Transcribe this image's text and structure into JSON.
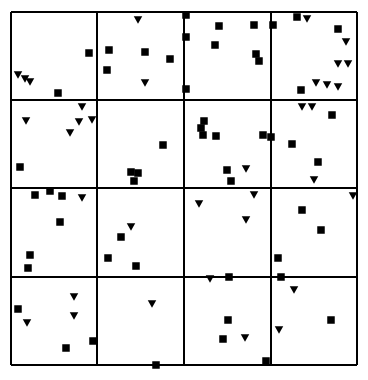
{
  "figure": {
    "name": "lattice-scatter-panel",
    "background_color": "#ffffff",
    "ink_color": "#000000",
    "width": 368,
    "height": 380
  },
  "chart_data": {
    "type": "scatter",
    "title": "",
    "subtitle": "",
    "xlabel": "",
    "ylabel": "",
    "grid": true,
    "legend_position": "none",
    "axis_ticks_visible": false,
    "tick_labels": [],
    "annotations": [],
    "xlim": [
      0,
      4
    ],
    "ylim": [
      0,
      4
    ],
    "panel": {
      "rows": 4,
      "cols": 4,
      "left": 11,
      "top": 12,
      "right": 357,
      "bottom": 365,
      "col_edges": [
        11,
        97,
        184,
        271,
        357
      ],
      "row_edges": [
        12,
        100,
        188,
        277,
        365
      ],
      "border_width": 1.6,
      "border_color": "#000000"
    },
    "marker_styles": {
      "square": {
        "name": "filled-square",
        "size": 7.5,
        "color": "#000000"
      },
      "triangle": {
        "name": "filled-down-triangle",
        "size": 8.5,
        "color": "#000000"
      }
    },
    "series": [
      {
        "name": "square",
        "marker": "square",
        "points": [
          [
            89,
            53
          ],
          [
            58,
            93
          ],
          [
            109,
            50
          ],
          [
            145,
            52
          ],
          [
            170,
            59
          ],
          [
            107,
            70
          ],
          [
            186,
            15
          ],
          [
            219,
            26
          ],
          [
            254,
            25
          ],
          [
            186,
            37
          ],
          [
            215,
            45
          ],
          [
            256,
            54
          ],
          [
            259,
            61
          ],
          [
            186,
            89
          ],
          [
            297,
            17
          ],
          [
            273,
            25
          ],
          [
            338,
            29
          ],
          [
            301,
            90
          ],
          [
            20,
            167
          ],
          [
            163,
            145
          ],
          [
            131,
            172
          ],
          [
            138,
            173
          ],
          [
            134,
            181
          ],
          [
            204,
            121
          ],
          [
            201,
            128
          ],
          [
            203,
            135
          ],
          [
            216,
            136
          ],
          [
            263,
            135
          ],
          [
            271,
            137
          ],
          [
            227,
            170
          ],
          [
            231,
            181
          ],
          [
            332,
            115
          ],
          [
            292,
            144
          ],
          [
            318,
            162
          ],
          [
            35,
            195
          ],
          [
            50,
            191
          ],
          [
            62,
            196
          ],
          [
            60,
            222
          ],
          [
            30,
            255
          ],
          [
            28,
            268
          ],
          [
            121,
            237
          ],
          [
            108,
            258
          ],
          [
            136,
            266
          ],
          [
            281,
            277
          ],
          [
            302,
            210
          ],
          [
            321,
            230
          ],
          [
            278,
            258
          ],
          [
            18,
            309
          ],
          [
            66,
            348
          ],
          [
            93,
            341
          ],
          [
            156,
            365
          ],
          [
            229,
            277
          ],
          [
            228,
            320
          ],
          [
            223,
            339
          ],
          [
            266,
            361
          ],
          [
            331,
            320
          ]
        ]
      },
      {
        "name": "triangle",
        "marker": "triangle",
        "points": [
          [
            18,
            75
          ],
          [
            25,
            79
          ],
          [
            30,
            82
          ],
          [
            138,
            20
          ],
          [
            145,
            83
          ],
          [
            307,
            19
          ],
          [
            346,
            42
          ],
          [
            338,
            64
          ],
          [
            348,
            64
          ],
          [
            316,
            83
          ],
          [
            327,
            85
          ],
          [
            338,
            87
          ],
          [
            82,
            107
          ],
          [
            26,
            121
          ],
          [
            79,
            122
          ],
          [
            92,
            120
          ],
          [
            70,
            133
          ],
          [
            246,
            169
          ],
          [
            302,
            107
          ],
          [
            312,
            107
          ],
          [
            314,
            180
          ],
          [
            82,
            198
          ],
          [
            131,
            227
          ],
          [
            254,
            195
          ],
          [
            199,
            204
          ],
          [
            246,
            220
          ],
          [
            353,
            196
          ],
          [
            74,
            297
          ],
          [
            27,
            323
          ],
          [
            74,
            316
          ],
          [
            152,
            304
          ],
          [
            210,
            279
          ],
          [
            245,
            338
          ],
          [
            294,
            290
          ],
          [
            279,
            330
          ]
        ]
      }
    ]
  }
}
